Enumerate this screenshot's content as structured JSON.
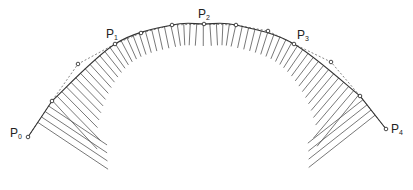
{
  "diagram": {
    "title": "",
    "colors": {
      "line": "#333333",
      "hatch": "#555555",
      "control": "#666666",
      "text": "#222222"
    },
    "labels": [
      {
        "id": "P0",
        "base": "P",
        "sub": "0",
        "x": 10,
        "y": 127
      },
      {
        "id": "P1",
        "base": "P",
        "sub": "1",
        "x": 106,
        "y": 28
      },
      {
        "id": "P2",
        "base": "P",
        "sub": "2",
        "x": 198,
        "y": 8
      },
      {
        "id": "P3",
        "base": "P",
        "sub": "3",
        "x": 297,
        "y": 29
      },
      {
        "id": "P4",
        "base": "P",
        "sub": "4",
        "x": 391,
        "y": 123
      }
    ],
    "control_points": [
      {
        "x": 28,
        "y": 137
      },
      {
        "x": 52,
        "y": 101
      },
      {
        "x": 78,
        "y": 64
      },
      {
        "x": 115,
        "y": 44
      },
      {
        "x": 141,
        "y": 33
      },
      {
        "x": 172,
        "y": 25
      },
      {
        "x": 204,
        "y": 24
      },
      {
        "x": 236,
        "y": 25
      },
      {
        "x": 268,
        "y": 31
      },
      {
        "x": 294,
        "y": 44
      },
      {
        "x": 331,
        "y": 62
      },
      {
        "x": 360,
        "y": 96
      },
      {
        "x": 386,
        "y": 129
      }
    ]
  }
}
